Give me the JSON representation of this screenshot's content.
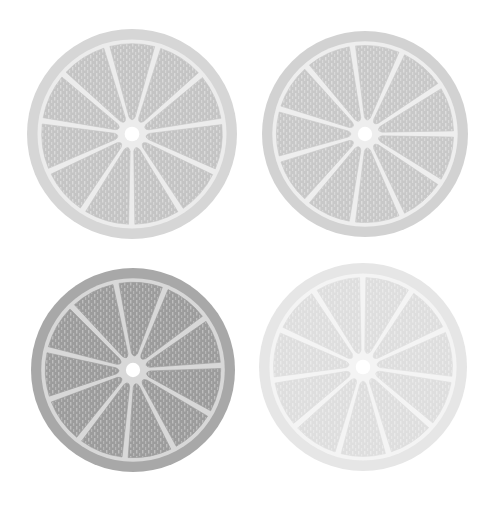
{
  "scene": {
    "description": "Four grayscale citrus slices arranged in a 2x2 grid",
    "background": "#ffffff"
  },
  "slices": [
    {
      "name": "top-left",
      "cx": 132,
      "cy": 134,
      "r": 105,
      "rind": "#d6d6d6",
      "pith": "#ececec",
      "flesh": "#c4c4c4",
      "rotation": -8
    },
    {
      "name": "top-right",
      "cx": 365,
      "cy": 134,
      "r": 103,
      "rind": "#d2d2d2",
      "pith": "#eeeeee",
      "flesh": "#c8c8c8",
      "rotation": 0
    },
    {
      "name": "bottom-left",
      "cx": 133,
      "cy": 370,
      "r": 102,
      "rind": "#a8a8a8",
      "pith": "#d8d8d8",
      "flesh": "#9c9c9c",
      "rotation": -3
    },
    {
      "name": "bottom-right",
      "cx": 363,
      "cy": 367,
      "r": 104,
      "rind": "#e6e6e6",
      "pith": "#f4f4f4",
      "flesh": "#dedede",
      "rotation": 8
    }
  ],
  "segments_per_slice": 11
}
